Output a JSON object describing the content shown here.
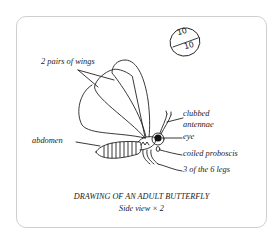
{
  "diagram": {
    "title": "DRAWING OF AN ADULT BUTTERFLY",
    "subtitle": "Side view × 2",
    "score": {
      "numerator": "10",
      "denominator": "10"
    },
    "labels": {
      "wings": "2 pairs of wings",
      "abdomen": "abdomen",
      "antennae_line1": "clubbed",
      "antennae_line2": "antennae",
      "eye": "eye",
      "proboscis": "coiled proboscis",
      "legs": "3 of the 6 legs"
    },
    "colors": {
      "ink": "#222222",
      "border": "#cfcfcf",
      "background": "#ffffff"
    }
  }
}
